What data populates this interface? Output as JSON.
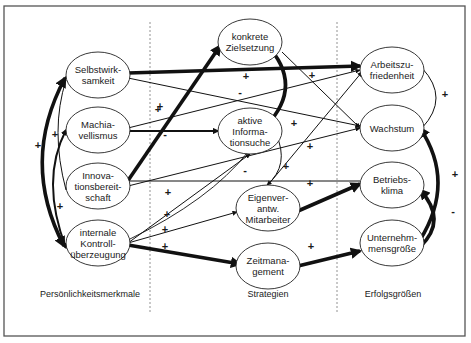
{
  "diagram": {
    "columns": [
      {
        "id": "traits",
        "label": "Persönlichkeitsmerkmale"
      },
      {
        "id": "strategies",
        "label": "Strategien"
      },
      {
        "id": "outcomes",
        "label": "Erfolgsgrößen"
      }
    ],
    "nodes": [
      {
        "id": "selbstwirksamkeit",
        "column": "traits",
        "lines": [
          "Selbstwirk-",
          "samkeit"
        ]
      },
      {
        "id": "machiavellismus",
        "column": "traits",
        "lines": [
          "Machia-",
          "vellismus"
        ]
      },
      {
        "id": "innovationsbereitschaft",
        "column": "traits",
        "lines": [
          "Innova-",
          "tionsbereit-",
          "schaft"
        ]
      },
      {
        "id": "kontrollueberzeugung",
        "column": "traits",
        "lines": [
          "internale",
          "Kontroll-",
          "überzeugung"
        ]
      },
      {
        "id": "zielsetzung",
        "column": "strategies",
        "lines": [
          "konkrete",
          "Zielsetzung"
        ]
      },
      {
        "id": "informationsuche",
        "column": "strategies",
        "lines": [
          "aktive",
          "Informa-",
          "tionsuche"
        ]
      },
      {
        "id": "eigenverantwortung",
        "column": "strategies",
        "lines": [
          "Eigenver-",
          "antw.",
          "Mitarbeiter"
        ]
      },
      {
        "id": "zeitmanagement",
        "column": "strategies",
        "lines": [
          "Zeitmana-",
          "gement"
        ]
      },
      {
        "id": "arbeitszufriedenheit",
        "column": "outcomes",
        "lines": [
          "Arbeitszu-",
          "friedenheit"
        ]
      },
      {
        "id": "wachstum",
        "column": "outcomes",
        "lines": [
          "Wachstum"
        ]
      },
      {
        "id": "betriebsklima",
        "column": "outcomes",
        "lines": [
          "Betriebs-",
          "klima"
        ]
      },
      {
        "id": "unternehmensgroesse",
        "column": "outcomes",
        "lines": [
          "Unternehm-",
          "mensgröße"
        ]
      }
    ],
    "edges": [
      {
        "from": "selbstwirksamkeit",
        "to": "arbeitszufriedenheit",
        "sign": "+",
        "strength": "strong"
      },
      {
        "from": "selbstwirksamkeit",
        "to": "wachstum",
        "sign": "-",
        "strength": "weak"
      },
      {
        "from": "machiavellismus",
        "to": "arbeitszufriedenheit",
        "sign": "+",
        "strength": "weak"
      },
      {
        "from": "machiavellismus",
        "to": "informationsuche",
        "sign": "-",
        "strength": "medium"
      },
      {
        "from": "innovationsbereitschaft",
        "to": "zielsetzung",
        "sign": "+",
        "strength": "strong"
      },
      {
        "from": "innovationsbereitschaft",
        "to": "wachstum",
        "sign": "+",
        "strength": "weak"
      },
      {
        "from": "innovationsbereitschaft",
        "to": "betriebsklima",
        "sign": "-",
        "strength": "weak"
      },
      {
        "from": "kontrollueberzeugung",
        "to": "informationsuche",
        "sign": "+",
        "strength": "weak"
      },
      {
        "from": "kontrollueberzeugung",
        "to": "eigenverantwortung",
        "sign": "+",
        "strength": "weak"
      },
      {
        "from": "kontrollueberzeugung",
        "to": "zeitmanagement",
        "sign": "+",
        "strength": "strong"
      },
      {
        "from": "kontrollueberzeugung",
        "to": "zielsetzung",
        "sign": "+",
        "strength": "weak"
      },
      {
        "from": "zielsetzung",
        "to": "informationsuche",
        "sign": "",
        "strength": "strong"
      },
      {
        "from": "zielsetzung",
        "to": "wachstum",
        "sign": "+",
        "strength": "weak"
      },
      {
        "from": "informationsuche",
        "to": "eigenverantwortung",
        "sign": "+",
        "strength": "weak"
      },
      {
        "from": "eigenverantwortung",
        "to": "arbeitszufriedenheit",
        "sign": "+",
        "strength": "weak"
      },
      {
        "from": "eigenverantwortung",
        "to": "betriebsklima",
        "sign": "+",
        "strength": "strong"
      },
      {
        "from": "zeitmanagement",
        "to": "unternehmensgroesse",
        "sign": "+",
        "strength": "strong"
      },
      {
        "from": "arbeitszufriedenheit",
        "to": "wachstum",
        "sign": "+",
        "strength": "weak"
      },
      {
        "from": "unternehmensgroesse",
        "to": "wachstum",
        "sign": "+",
        "strength": "strong"
      },
      {
        "from": "unternehmensgroesse",
        "to": "betriebsklima",
        "sign": "-",
        "strength": "strong"
      },
      {
        "from": "selbstwirksamkeit",
        "to": "kontrollueberzeugung",
        "sign": "+",
        "strength": "strong"
      },
      {
        "from": "machiavellismus",
        "to": "kontrollueberzeugung",
        "sign": "+",
        "strength": "medium"
      },
      {
        "from": "innovationsbereitschaft",
        "to": "selbstwirksamkeit",
        "sign": "+",
        "strength": "weak"
      }
    ]
  }
}
